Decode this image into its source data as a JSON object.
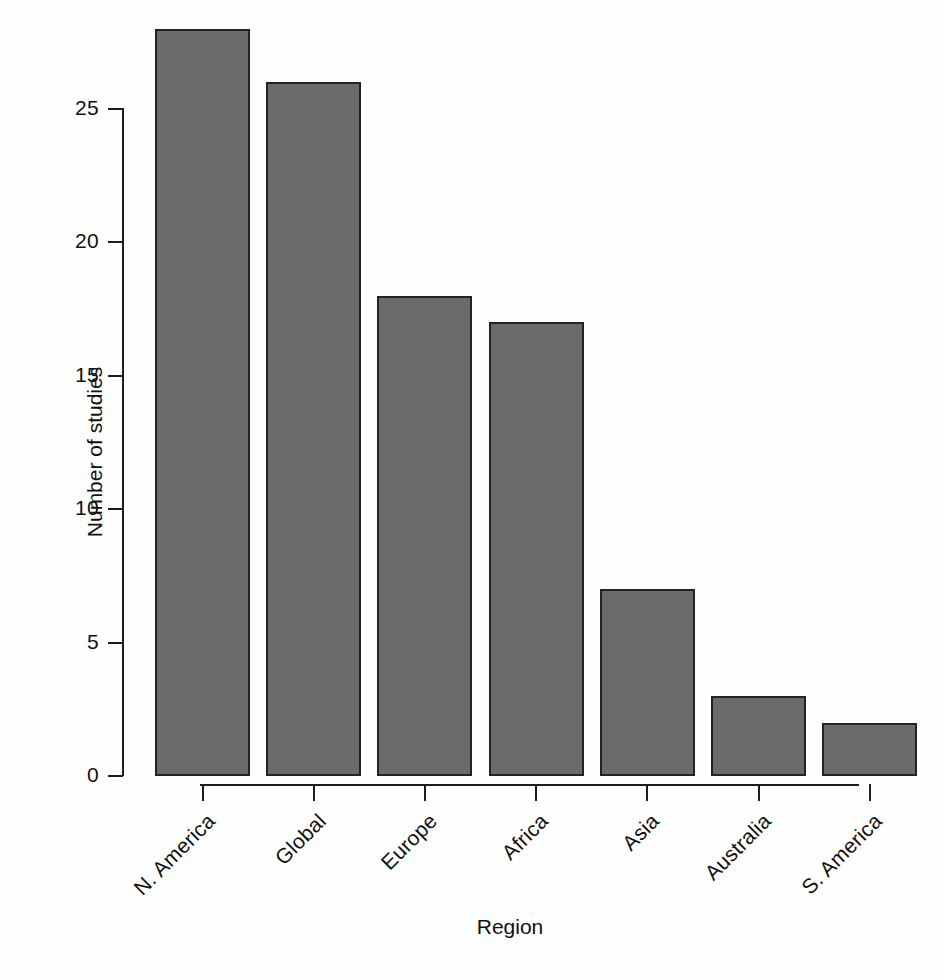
{
  "chart_data": {
    "type": "bar",
    "title": "",
    "subtitle": "",
    "xlabel": "Region",
    "ylabel": "Number of studies",
    "categories": [
      "N. America",
      "Global",
      "Europe",
      "Africa",
      "Asia",
      "Australia",
      "S. America"
    ],
    "values": [
      28,
      26,
      18,
      17,
      7,
      3,
      2
    ],
    "ylim": [
      0,
      28
    ],
    "y_ticks": [
      0,
      5,
      10,
      15,
      20,
      25
    ],
    "y_tick_labels": [
      "0",
      "5",
      "10",
      "15",
      "20",
      "25"
    ],
    "grid": false,
    "legend": false,
    "legend_position": "none",
    "orientation": "vertical",
    "bar_fill_color": "#6b6b6b",
    "bar_border_color": "#232323",
    "background_color": "#ffffff",
    "axis_color": "#1d1d1d",
    "text_color": "#111111",
    "x_tick_label_rotation_degrees": 45,
    "annotations": []
  }
}
